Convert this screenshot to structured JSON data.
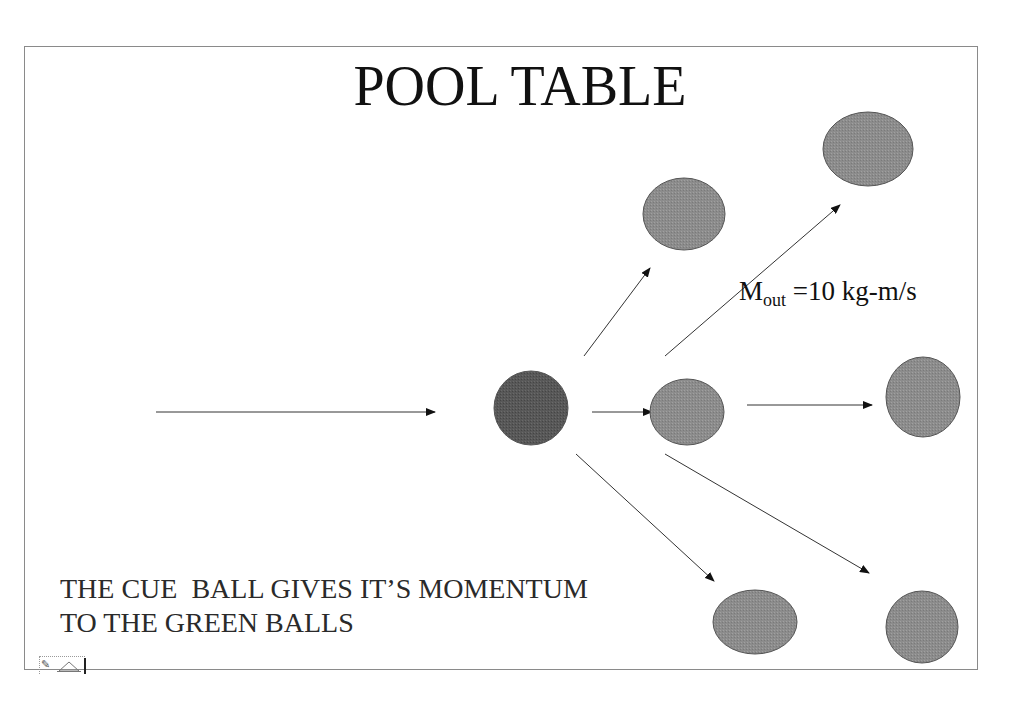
{
  "slide": {
    "title": "POOL TABLE",
    "annotation": {
      "symbol": "M",
      "subscript": "out",
      "value_text": " =10 kg-m/s"
    },
    "caption_lines": [
      "THE CUE  BALL GIVES IT’S MOMENTUM",
      "TO THE GREEN BALLS"
    ],
    "colors": {
      "cue_ball": "#555555",
      "green_ball": "#8a8a8a",
      "arrow": "#333333",
      "frame": "#8a8a8a"
    }
  },
  "diagram": {
    "balls": [
      {
        "id": "cue-ball",
        "role": "cue",
        "cx": 531,
        "cy": 408,
        "rx": 37,
        "ry": 37
      },
      {
        "id": "green-ball-center",
        "role": "green",
        "cx": 687,
        "cy": 412,
        "rx": 37,
        "ry": 33
      },
      {
        "id": "green-ball-upper",
        "role": "green",
        "cx": 684,
        "cy": 214,
        "rx": 41,
        "ry": 36
      },
      {
        "id": "green-ball-top-right",
        "role": "green",
        "cx": 868,
        "cy": 149,
        "rx": 45,
        "ry": 37
      },
      {
        "id": "green-ball-right",
        "role": "green",
        "cx": 923,
        "cy": 397,
        "rx": 37,
        "ry": 40
      },
      {
        "id": "green-ball-bottom",
        "role": "green",
        "cx": 755,
        "cy": 622,
        "rx": 42,
        "ry": 32
      },
      {
        "id": "green-ball-bottom-right",
        "role": "green",
        "cx": 922,
        "cy": 627,
        "rx": 36,
        "ry": 36
      }
    ],
    "arrows": [
      {
        "id": "arrow-incoming",
        "x1": 156,
        "y1": 412,
        "x2": 435,
        "y2": 412
      },
      {
        "id": "arrow-cue-to-center",
        "x1": 592,
        "y1": 412,
        "x2": 652,
        "y2": 412
      },
      {
        "id": "arrow-to-upper",
        "x1": 584,
        "y1": 356,
        "x2": 650,
        "y2": 268
      },
      {
        "id": "arrow-to-top-right",
        "x1": 665,
        "y1": 356,
        "x2": 840,
        "y2": 205
      },
      {
        "id": "arrow-to-right",
        "x1": 747,
        "y1": 405,
        "x2": 872,
        "y2": 405
      },
      {
        "id": "arrow-to-bottom",
        "x1": 576,
        "y1": 454,
        "x2": 714,
        "y2": 581
      },
      {
        "id": "arrow-to-bottom-right",
        "x1": 665,
        "y1": 454,
        "x2": 869,
        "y2": 573
      }
    ]
  },
  "toolbar": {
    "pen_icon": "✎",
    "nav_icon": "triangle-icon"
  }
}
